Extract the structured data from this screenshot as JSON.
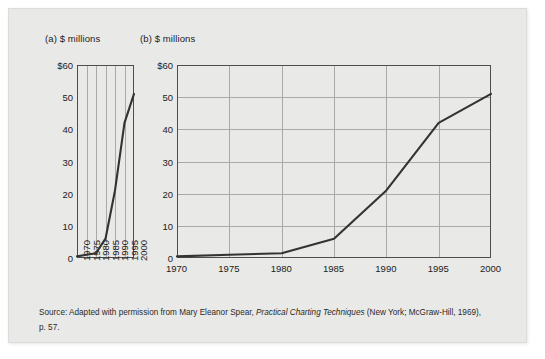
{
  "figure": {
    "background_color": "#e9e9e7",
    "line_color": "#333333",
    "grid_color": "#a9a9a7",
    "axis_color": "#4d4d4d"
  },
  "charts": [
    {
      "id": "a",
      "title": "(a) $ millions",
      "x_label_orientation": "vertical"
    },
    {
      "id": "b",
      "title": "(b) $ millions",
      "x_label_orientation": "horizontal"
    }
  ],
  "source": {
    "prefix": "Source: Adapted with permission from Mary Eleanor Spear, ",
    "title_italic": "Practical Charting Techniques",
    "suffix": " (New York; McGraw-Hill, 1969),",
    "line2": "p. 57."
  },
  "chart_data": [
    {
      "type": "line",
      "id": "a",
      "title": "(a) $ millions",
      "xlabel": "",
      "ylabel": "$ millions",
      "x": [
        1970,
        1975,
        1980,
        1985,
        1990,
        1995,
        2000
      ],
      "categories": [
        "1970",
        "1975",
        "1980",
        "1985",
        "1990",
        "1995",
        "2000"
      ],
      "values": [
        0.5,
        1,
        1.5,
        6,
        21,
        42,
        51
      ],
      "series": [
        {
          "name": "revenue",
          "values": [
            0.5,
            1,
            1.5,
            6,
            21,
            42,
            51
          ]
        }
      ],
      "xlim": [
        1970,
        2000
      ],
      "ylim": [
        0,
        60
      ],
      "yticks": [
        0,
        10,
        20,
        30,
        40,
        50,
        60
      ],
      "ytick_labels": [
        "0",
        "10",
        "20",
        "30",
        "40",
        "50",
        "$60"
      ],
      "xticks": [
        1970,
        1975,
        1980,
        1985,
        1990,
        1995,
        2000
      ],
      "xtick_labels": [
        "1970",
        "1975",
        "1980",
        "1985",
        "1990",
        "1995",
        "2000"
      ],
      "grid": "vertical-only",
      "legend": "none",
      "aspect_note": "narrow / compressed horizontal scale"
    },
    {
      "type": "line",
      "id": "b",
      "title": "(b) $ millions",
      "xlabel": "",
      "ylabel": "$ millions",
      "x": [
        1970,
        1975,
        1980,
        1985,
        1990,
        1995,
        2000
      ],
      "categories": [
        "1970",
        "1975",
        "1980",
        "1985",
        "1990",
        "1995",
        "2000"
      ],
      "values": [
        0.5,
        1,
        1.5,
        6,
        21,
        42,
        51
      ],
      "series": [
        {
          "name": "revenue",
          "values": [
            0.5,
            1,
            1.5,
            6,
            21,
            42,
            51
          ]
        }
      ],
      "xlim": [
        1970,
        2000
      ],
      "ylim": [
        0,
        60
      ],
      "yticks": [
        0,
        10,
        20,
        30,
        40,
        50,
        60
      ],
      "ytick_labels": [
        "0",
        "10",
        "20",
        "30",
        "40",
        "50",
        "$60"
      ],
      "xticks": [
        1970,
        1975,
        1980,
        1985,
        1990,
        1995,
        2000
      ],
      "xtick_labels": [
        "1970",
        "1975",
        "1980",
        "1985",
        "1990",
        "1995",
        "2000"
      ],
      "grid": "both",
      "legend": "none",
      "aspect_note": "wide / expanded horizontal scale"
    }
  ]
}
